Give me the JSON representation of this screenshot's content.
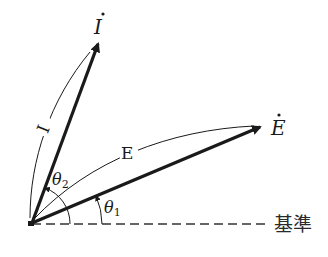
{
  "diagram": {
    "type": "phasor-diagram",
    "vectors": [
      {
        "name": "I-dot",
        "label": "İ",
        "magnitude_label": "I",
        "angle_label": "θ₂"
      },
      {
        "name": "E-dot",
        "label": "Ė",
        "magnitude_label": "E",
        "angle_label": "θ₁"
      }
    ],
    "reference": {
      "label": "基準",
      "style": "dashed"
    },
    "labels": {
      "i_vector": "I",
      "e_vector": "E",
      "i_magnitude": "I",
      "e_magnitude": "E",
      "theta2_main": "θ",
      "theta2_sub": "2",
      "theta1_main": "θ",
      "theta1_sub": "1",
      "reference": "基準"
    },
    "colors": {
      "line": "#1a1a1a",
      "background": "#ffffff"
    }
  }
}
